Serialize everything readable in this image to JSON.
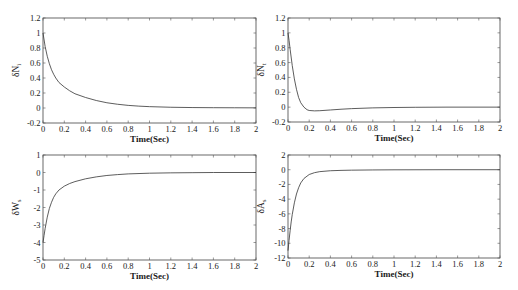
{
  "chart_data": [
    {
      "type": "line",
      "id": "dNi",
      "title": "",
      "xlabel": "Time(Sec)",
      "ylabel": "δN",
      "ylabel_sub": "i",
      "xlim": [
        0,
        2
      ],
      "ylim": [
        -0.2,
        1.2
      ],
      "xticks": [
        0,
        0.2,
        0.4,
        0.6,
        0.8,
        1,
        1.2,
        1.4,
        1.6,
        1.8,
        2
      ],
      "xtick_labels": [
        "0",
        "0.2",
        "0.4",
        "0.6",
        "0.8",
        "1",
        "1.2",
        "1.4",
        "1.6",
        "1.8",
        "2"
      ],
      "yticks": [
        -0.2,
        0,
        0.2,
        0.4,
        0.6,
        0.8,
        1,
        1.2
      ],
      "ytick_labels": [
        "-0.2",
        "0",
        "0.2",
        "0.4",
        "0.6",
        "0.8",
        "1",
        "1.2"
      ],
      "grid": false,
      "box": {
        "x": 43,
        "y": 18,
        "w": 213,
        "h": 105
      },
      "series": [
        {
          "name": "δN_i",
          "x": [
            0,
            0.02,
            0.04,
            0.06,
            0.08,
            0.1,
            0.12,
            0.15,
            0.2,
            0.25,
            0.3,
            0.4,
            0.5,
            0.6,
            0.7,
            0.8,
            0.9,
            1.0,
            1.2,
            1.4,
            1.6,
            1.8,
            2.0
          ],
          "y": [
            1.0,
            0.82,
            0.69,
            0.59,
            0.51,
            0.45,
            0.4,
            0.34,
            0.28,
            0.23,
            0.19,
            0.14,
            0.1,
            0.07,
            0.05,
            0.035,
            0.025,
            0.018,
            0.01,
            0.006,
            0.004,
            0.003,
            0.002
          ]
        }
      ]
    },
    {
      "type": "line",
      "id": "dNt",
      "title": "",
      "xlabel": "Time(Sec)",
      "ylabel": "δN",
      "ylabel_sub": "t",
      "xlim": [
        0,
        2
      ],
      "ylim": [
        -0.2,
        1.2
      ],
      "xticks": [
        0,
        0.2,
        0.4,
        0.6,
        0.8,
        1,
        1.2,
        1.4,
        1.6,
        1.8,
        2
      ],
      "xtick_labels": [
        "0",
        "0.2",
        "0.4",
        "0.6",
        "0.8",
        "1",
        "1.2",
        "1.4",
        "1.6",
        "1.8",
        "2"
      ],
      "yticks": [
        -0.2,
        0,
        0.2,
        0.4,
        0.6,
        0.8,
        1,
        1.2
      ],
      "ytick_labels": [
        "-0.2",
        "0",
        "0.2",
        "0.4",
        "0.6",
        "0.8",
        "1",
        "1.2"
      ],
      "grid": false,
      "box": {
        "x": 288,
        "y": 18,
        "w": 212,
        "h": 104
      },
      "series": [
        {
          "name": "δN_t",
          "x": [
            0,
            0.01,
            0.02,
            0.04,
            0.06,
            0.08,
            0.1,
            0.12,
            0.15,
            0.18,
            0.2,
            0.25,
            0.3,
            0.4,
            0.5,
            0.6,
            0.8,
            1.0,
            1.2,
            1.5,
            2.0
          ],
          "y": [
            1.0,
            0.9,
            0.78,
            0.56,
            0.38,
            0.24,
            0.13,
            0.06,
            0.0,
            -0.035,
            -0.045,
            -0.05,
            -0.048,
            -0.038,
            -0.028,
            -0.02,
            -0.01,
            -0.005,
            -0.002,
            0.0,
            0.0
          ]
        }
      ]
    },
    {
      "type": "line",
      "id": "dWs",
      "title": "",
      "xlabel": "Time(Sec)",
      "ylabel": "δW",
      "ylabel_sub": "s",
      "xlim": [
        0,
        2
      ],
      "ylim": [
        -5,
        1
      ],
      "xticks": [
        0,
        0.2,
        0.4,
        0.6,
        0.8,
        1,
        1.2,
        1.4,
        1.6,
        1.8,
        2
      ],
      "xtick_labels": [
        "0",
        "0.2",
        "0.4",
        "0.6",
        "0.8",
        "1",
        "1.2",
        "1.4",
        "1.6",
        "1.8",
        "2"
      ],
      "yticks": [
        -5,
        -4,
        -3,
        -2,
        -1,
        0,
        1
      ],
      "ytick_labels": [
        "-5",
        "-4",
        "-3",
        "-2",
        "-1",
        "0",
        "1"
      ],
      "grid": false,
      "box": {
        "x": 43,
        "y": 155,
        "w": 213,
        "h": 105
      },
      "series": [
        {
          "name": "δW_s",
          "x": [
            0,
            0.01,
            0.02,
            0.04,
            0.06,
            0.08,
            0.1,
            0.12,
            0.15,
            0.2,
            0.25,
            0.3,
            0.4,
            0.5,
            0.6,
            0.7,
            0.8,
            1.0,
            1.2,
            1.4,
            1.6,
            2.0
          ],
          "y": [
            -4.0,
            -3.6,
            -3.2,
            -2.55,
            -2.05,
            -1.7,
            -1.42,
            -1.22,
            -1.0,
            -0.78,
            -0.63,
            -0.52,
            -0.36,
            -0.25,
            -0.17,
            -0.12,
            -0.08,
            -0.04,
            -0.02,
            -0.01,
            0.0,
            0.0
          ]
        }
      ]
    },
    {
      "type": "line",
      "id": "dAs",
      "title": "",
      "xlabel": "Time(Sec)",
      "ylabel": "δA",
      "ylabel_sub": "s",
      "xlim": [
        0,
        2
      ],
      "ylim": [
        -12,
        2
      ],
      "xticks": [
        0,
        0.2,
        0.4,
        0.6,
        0.8,
        1,
        1.2,
        1.4,
        1.6,
        1.8,
        2
      ],
      "xtick_labels": [
        "0",
        "0.2",
        "0.4",
        "0.6",
        "0.8",
        "1",
        "1.2",
        "1.4",
        "1.6",
        "1.8",
        "2"
      ],
      "yticks": [
        -12,
        -10,
        -8,
        -6,
        -4,
        -2,
        0,
        2
      ],
      "ytick_labels": [
        "-12",
        "-10",
        "-8",
        "-6",
        "-4",
        "-2",
        "0",
        "2"
      ],
      "grid": false,
      "box": {
        "x": 288,
        "y": 155,
        "w": 212,
        "h": 103
      },
      "series": [
        {
          "name": "δA_s",
          "x": [
            0,
            0.01,
            0.02,
            0.03,
            0.04,
            0.06,
            0.08,
            0.1,
            0.12,
            0.15,
            0.2,
            0.25,
            0.3,
            0.4,
            0.5,
            0.6,
            0.8,
            1.0,
            1.5,
            2.0
          ],
          "y": [
            -11.0,
            -9.6,
            -8.3,
            -7.1,
            -6.1,
            -4.5,
            -3.3,
            -2.45,
            -1.8,
            -1.2,
            -0.65,
            -0.4,
            -0.26,
            -0.14,
            -0.09,
            -0.06,
            -0.03,
            -0.015,
            0.0,
            0.0
          ]
        }
      ]
    }
  ]
}
